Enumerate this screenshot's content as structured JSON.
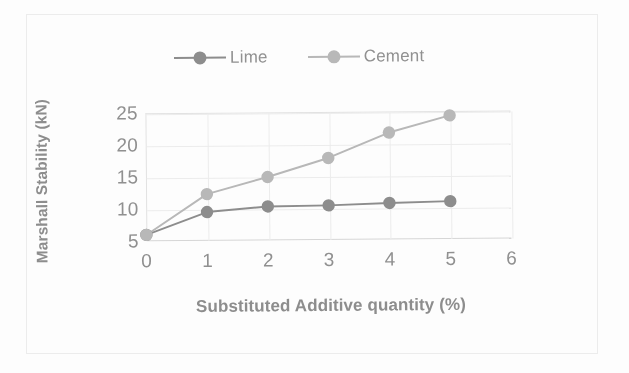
{
  "figure": {
    "background": "#fdfdfd",
    "frame_color": "#ececec"
  },
  "chart_data": {
    "type": "line",
    "title": "",
    "xlabel": "Substituted Additive quantity (%)",
    "ylabel": "Marshall Stability (kN)",
    "x": [
      0,
      1,
      2,
      3,
      4,
      5
    ],
    "categories": [
      "0",
      "1",
      "2",
      "3",
      "4",
      "5"
    ],
    "series": [
      {
        "name": "Lime",
        "color": "#8a8a8a",
        "marker": "circle",
        "values": [
          6.0,
          9.5,
          10.3,
          10.4,
          10.7,
          10.9
        ]
      },
      {
        "name": "Cement",
        "color": "#b6b6b6",
        "marker": "circle",
        "values": [
          6.0,
          12.3,
          14.9,
          17.8,
          21.7,
          24.3
        ]
      }
    ],
    "xlim": [
      0,
      6
    ],
    "ylim": [
      5,
      25
    ],
    "xticks": [
      0,
      1,
      2,
      3,
      4,
      5,
      6
    ],
    "xtick_labels": [
      "0",
      "1",
      "2",
      "3",
      "4",
      "5",
      "6"
    ],
    "yticks": [
      5,
      10,
      15,
      20,
      25
    ],
    "ytick_labels": [
      "5",
      "10",
      "15",
      "20",
      "25"
    ],
    "grid": true,
    "grid_color": "#ededed",
    "legend_position": "top",
    "legend_entries": [
      "Lime",
      "Cement"
    ]
  }
}
